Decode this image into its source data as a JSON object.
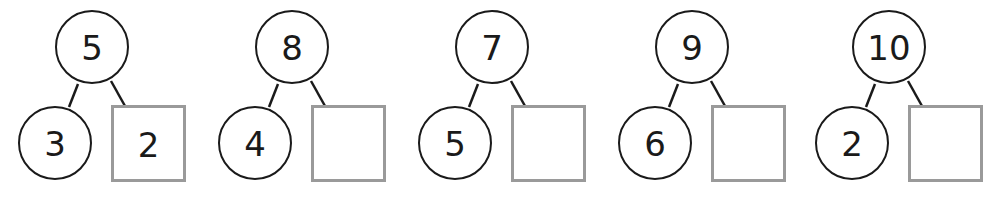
{
  "worksheet": {
    "type": "number-bonds",
    "line_color": "#1a1a1a",
    "answer_box_border_color": "#9a9a9a",
    "bonds": [
      {
        "whole": "5",
        "part_left": "3",
        "part_right": "2",
        "offset_x": 0
      },
      {
        "whole": "8",
        "part_left": "4",
        "part_right": "",
        "offset_x": 200
      },
      {
        "whole": "7",
        "part_left": "5",
        "part_right": "",
        "offset_x": 400
      },
      {
        "whole": "9",
        "part_left": "6",
        "part_right": "",
        "offset_x": 600
      },
      {
        "whole": "10",
        "part_left": "2",
        "part_right": "",
        "offset_x": 795
      }
    ]
  }
}
